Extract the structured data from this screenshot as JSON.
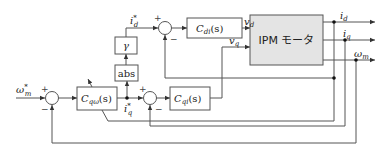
{
  "diagram": {
    "type": "control-block-diagram",
    "plant": {
      "label": "IPM モータ"
    },
    "blocks": {
      "c_di": {
        "name": "C",
        "sub": "di",
        "arg": "(s)"
      },
      "c_qomega": {
        "name": "C",
        "sub": "qω",
        "arg": "(s)"
      },
      "c_qi": {
        "name": "C",
        "sub": "qi",
        "arg": "(s)"
      },
      "gamma": {
        "label": "γ"
      },
      "abs": {
        "label": "abs"
      }
    },
    "signals": {
      "omega_ref": {
        "base": "ω",
        "sub": "m",
        "sup": "*"
      },
      "id_ref": {
        "base": "i",
        "sub": "d",
        "sup": "*"
      },
      "iq_ref": {
        "base": "i",
        "sub": "q",
        "sup": "*"
      },
      "vd": {
        "base": "v",
        "sub": "d"
      },
      "vq": {
        "base": "v",
        "sub": "q"
      },
      "id": {
        "base": "i",
        "sub": "d"
      },
      "iq": {
        "base": "i",
        "sub": "q"
      },
      "omega_m": {
        "base": "ω",
        "sub": "m"
      }
    },
    "signs": {
      "plus": "+",
      "minus": "−"
    }
  }
}
